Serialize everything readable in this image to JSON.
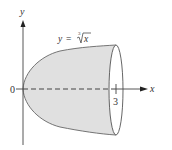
{
  "diagram": {
    "type": "solid-of-revolution",
    "curve_label": {
      "lhs": "y",
      "equals": "=",
      "root_index": "3",
      "radicand": "x"
    },
    "axes": {
      "x_label": "x",
      "y_label": "y",
      "origin_label": "0",
      "x_tick_label": "3"
    },
    "colors": {
      "fill": "#e0e0e0",
      "stroke": "#555555",
      "axis": "#444444"
    }
  }
}
